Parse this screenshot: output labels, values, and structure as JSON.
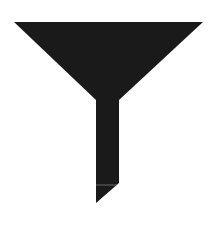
{
  "icon": {
    "name": "funnel-icon",
    "fill_color": "#1a1a1a",
    "background_color": "#ffffff",
    "seam_color": "#9a9a9a"
  }
}
